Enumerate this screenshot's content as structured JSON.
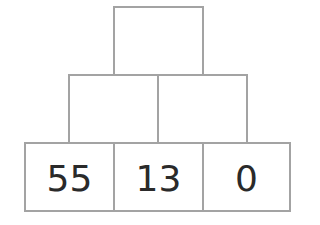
{
  "pyramid": {
    "rows": [
      {
        "row": "top",
        "cells": [
          ""
        ]
      },
      {
        "row": "middle",
        "cells": [
          "",
          ""
        ]
      },
      {
        "row": "bottom",
        "cells": [
          "55",
          "13",
          "0"
        ]
      }
    ],
    "colors": {
      "border": "#a3a3a3",
      "text": "#2a2a2a",
      "background": "#ffffff"
    }
  }
}
